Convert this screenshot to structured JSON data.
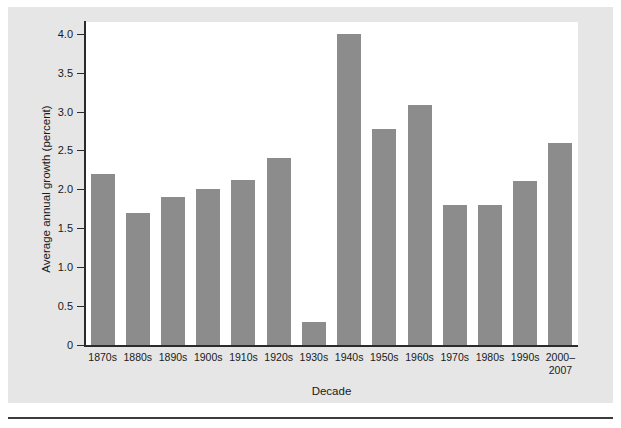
{
  "chart_data": {
    "type": "bar",
    "title": "",
    "xlabel": "Decade",
    "ylabel": "Average annual growth (percent)",
    "categories": [
      "1870s",
      "1880s",
      "1890s",
      "1900s",
      "1910s",
      "1920s",
      "1930s",
      "1940s",
      "1950s",
      "1960s",
      "1970s",
      "1980s",
      "1990s",
      "2000–\n2007"
    ],
    "values": [
      2.2,
      1.7,
      1.9,
      2.0,
      2.12,
      2.4,
      0.3,
      4.0,
      2.78,
      3.09,
      1.8,
      1.8,
      2.11,
      2.6
    ],
    "ylim": [
      0,
      4.15
    ],
    "yticks": [
      0,
      0.5,
      1.0,
      1.5,
      2.0,
      2.5,
      3.0,
      3.5,
      4.0
    ],
    "ytick_labels": [
      "0",
      "0.5",
      "1.0",
      "1.5",
      "2.0",
      "2.5",
      "3.0",
      "3.5",
      "4.0"
    ],
    "grid": false,
    "legend": null,
    "bar_color": "#8c8c8c",
    "plot_background": "#ffffff",
    "figure_background": "#e6e6e6",
    "axis_color": "#2b2b2b"
  }
}
